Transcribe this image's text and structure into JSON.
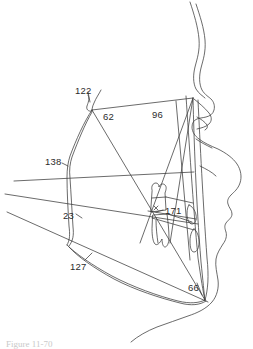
{
  "figure": {
    "kind": "cephalometric-profile-tracing",
    "caption": "Figure 11-70",
    "background_color": "#ffffff",
    "line_color": "#3a3a3a",
    "label_color": "#2b2b2b"
  },
  "reference_labels": [
    {
      "id": "122",
      "text": "122",
      "x": 75,
      "y": 86,
      "points_to": "nasion-vertex"
    },
    {
      "id": "62",
      "text": "62",
      "x": 103,
      "y": 112,
      "points_to": "upper-anterior-plane"
    },
    {
      "id": "96",
      "text": "96",
      "x": 152,
      "y": 110,
      "points_to": "vertical-reference-line"
    },
    {
      "id": "138",
      "text": "138",
      "x": 45,
      "y": 157,
      "points_to": "left-lateral-contour"
    },
    {
      "id": "23",
      "text": "23",
      "x": 63,
      "y": 211,
      "points_to": "occlusal-reference-line"
    },
    {
      "id": "171",
      "text": "171",
      "x": 165,
      "y": 206,
      "points_to": "molar-landmark"
    },
    {
      "id": "127",
      "text": "127",
      "x": 70,
      "y": 262,
      "points_to": "mandibular-border-line"
    },
    {
      "id": "66",
      "text": "66",
      "x": 188,
      "y": 283,
      "points_to": "gonion-menton-vertex"
    }
  ],
  "geometry": {
    "vertices": {
      "apex_122": [
        92,
        110
      ],
      "upper_right": [
        193,
        98
      ],
      "left_mid_138": [
        68,
        163
      ],
      "left_low": [
        66,
        243
      ],
      "converge_66": [
        205,
        300
      ]
    },
    "left_edge_line_starts_y": [
      181,
      194,
      212
    ]
  }
}
